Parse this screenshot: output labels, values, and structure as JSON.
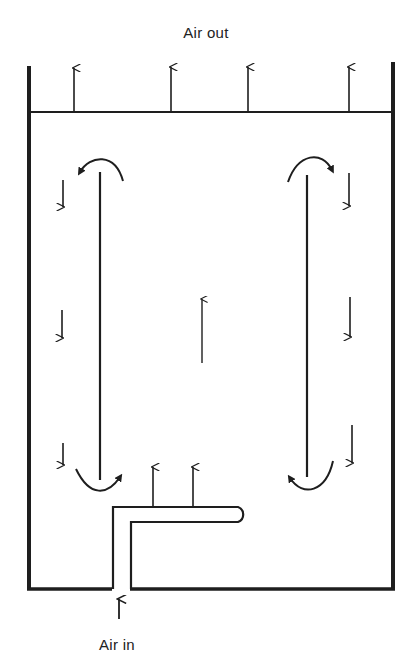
{
  "diagram": {
    "title_top": "Air out",
    "title_bottom": "Air in",
    "colors": {
      "ink": "#1e1e1e",
      "background": "#ffffff"
    },
    "elements": [
      "vessel-walls",
      "top-mesh-line",
      "air-out-arrows (4, upward)",
      "left-baffle (vertical plate)",
      "right-baffle (vertical plate)",
      "central-upward-arrow",
      "left-downward-arrows (3)",
      "right-downward-arrows (3)",
      "curved-recirculation-arrows (4)",
      "inlet-pipe (L-shaped distributor)",
      "inlet-upward-arrows (2)",
      "air-in-arrow"
    ]
  }
}
